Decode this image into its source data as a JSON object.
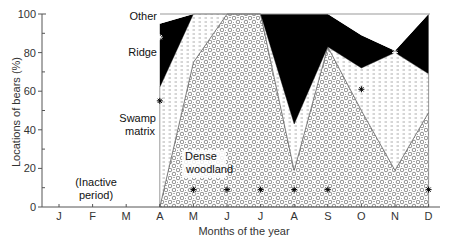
{
  "chart_data": {
    "type": "area",
    "stacked": true,
    "title": "",
    "xlabel": "Months of the year",
    "ylabel": "Locations of bears (%)",
    "ylim": [
      0,
      100
    ],
    "yticks": [
      0,
      20,
      40,
      60,
      80,
      100
    ],
    "categories": [
      "J",
      "F",
      "M",
      "A",
      "M",
      "J",
      "J",
      "A",
      "S",
      "O",
      "N",
      "D"
    ],
    "active_from_index": 3,
    "series": [
      {
        "name": "Dense woodland",
        "pattern": "circles",
        "values": [
          null,
          null,
          null,
          0,
          75,
          100,
          100,
          19,
          83,
          50,
          19,
          49
        ]
      },
      {
        "name": "Swamp matrix",
        "pattern": "dashes",
        "values": [
          null,
          null,
          null,
          62,
          25,
          0,
          0,
          24,
          0,
          22,
          61,
          20
        ]
      },
      {
        "name": "Ridge",
        "pattern": "solid-black",
        "values": [
          null,
          null,
          null,
          33,
          0,
          0,
          0,
          57,
          17,
          17,
          1,
          31
        ]
      },
      {
        "name": "Other",
        "pattern": "white",
        "values": [
          null,
          null,
          null,
          5,
          0,
          0,
          0,
          0,
          0,
          11,
          19,
          0
        ]
      }
    ],
    "annotations": [
      {
        "text": "(Inactive",
        "line2": "period)",
        "x_month_index": 1,
        "y": 10
      },
      {
        "text": "Dense",
        "line2": "woodland"
      },
      {
        "text": "Swamp",
        "line2": "matrix"
      },
      {
        "text": "Ridge"
      },
      {
        "text": "Other"
      }
    ],
    "markers": [
      {
        "month_index": 3,
        "y": 88,
        "layer": "Ridge"
      },
      {
        "month_index": 3,
        "y": 55,
        "layer": "Swamp matrix"
      },
      {
        "month_index": 9,
        "y": 61,
        "layer": "Swamp matrix"
      },
      {
        "month_index": 10,
        "y": 80,
        "layer": "Ridge"
      },
      {
        "month_index": 4,
        "y": 9,
        "layer": "Dense woodland"
      },
      {
        "month_index": 5,
        "y": 9,
        "layer": "Dense woodland"
      },
      {
        "month_index": 6,
        "y": 9,
        "layer": "Dense woodland"
      },
      {
        "month_index": 7,
        "y": 9,
        "layer": "Dense woodland"
      },
      {
        "month_index": 8,
        "y": 9,
        "layer": "Dense woodland"
      },
      {
        "month_index": 11,
        "y": 9,
        "layer": "Dense woodland"
      }
    ],
    "grid": false,
    "legend": "inline labels"
  },
  "labels": {
    "ylabel": "Locations of bears (%)",
    "xlabel": "Months of the year",
    "inactive_1": "(Inactive",
    "inactive_2": "period)",
    "woodland_1": "Dense",
    "woodland_2": "woodland",
    "swamp_1": "Swamp",
    "swamp_2": "matrix",
    "ridge": "Ridge",
    "other": "Other"
  },
  "colors": {
    "ridge": "#000000",
    "axis": "#555555",
    "text": "#333333"
  }
}
